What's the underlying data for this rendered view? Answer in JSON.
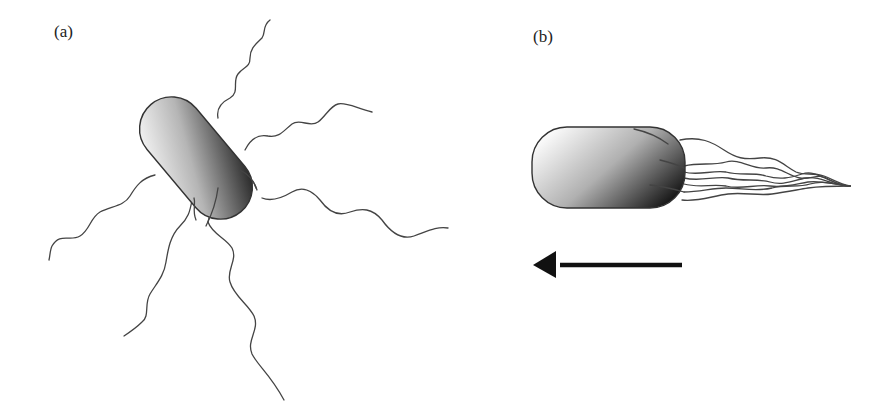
{
  "figure": {
    "panels": [
      {
        "id": "a",
        "label": "(a)",
        "description": "Rod-shaped bacterium with peritrichous flagella pointing in all directions"
      },
      {
        "id": "b",
        "label": "(b)",
        "description": "Rod-shaped bacterium with flagella bundled behind, swimming left"
      }
    ],
    "arrow": {
      "direction": "left",
      "color": "#111111"
    },
    "colors": {
      "cell_light": "#ffffff",
      "cell_dark": "#111111",
      "outline": "#333333",
      "flagella": "#444444"
    }
  }
}
